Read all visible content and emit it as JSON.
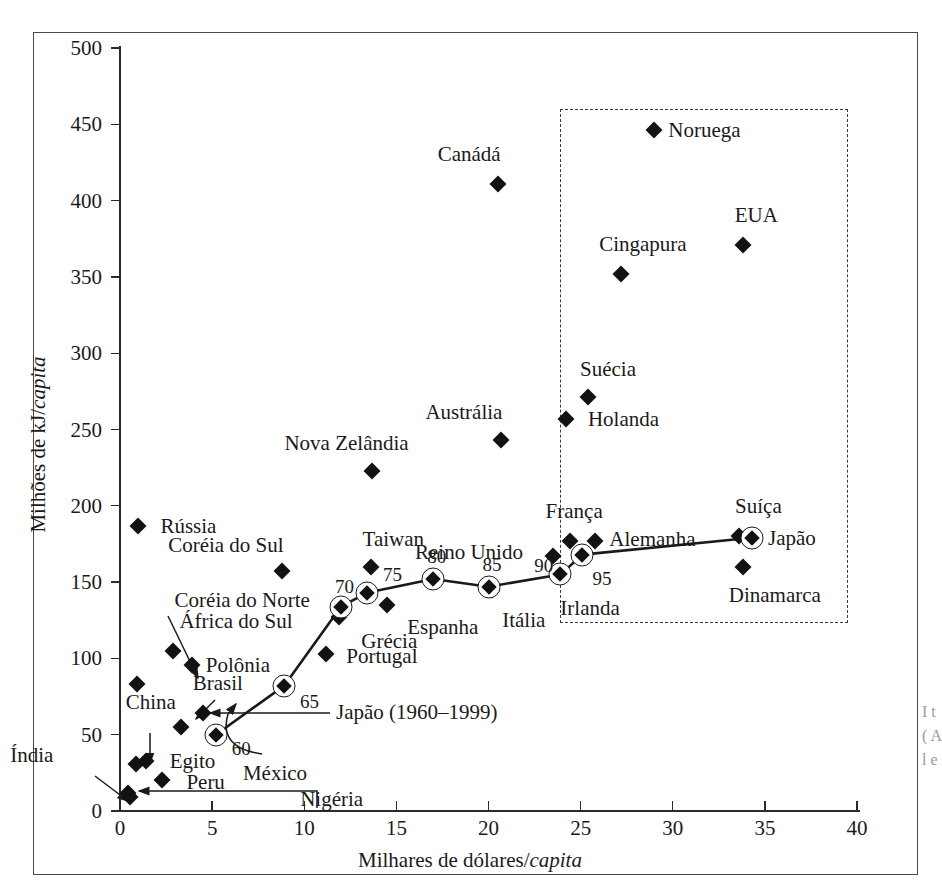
{
  "axes": {
    "x_title_main": "Milhares de dólares/",
    "x_title_italic": "capita",
    "y_title_main": "Milhões de kJ/",
    "y_title_italic": "capita",
    "x_ticks": [
      "0",
      "5",
      "10",
      "15",
      "20",
      "25",
      "30",
      "35",
      "40"
    ],
    "y_ticks": [
      "0",
      "50",
      "100",
      "150",
      "200",
      "250",
      "300",
      "350",
      "400",
      "450",
      "500"
    ],
    "xlim": [
      0,
      40
    ],
    "ylim": [
      0,
      500
    ]
  },
  "series_label": "Japão (1960–1999)",
  "chart_data": {
    "type": "scatter",
    "title": "",
    "xlabel": "Milhares de dólares/capita",
    "ylabel": "Milhões de kJ/capita",
    "xlim": [
      0,
      40
    ],
    "ylim": [
      0,
      500
    ],
    "grid": false,
    "legend": "none",
    "annotations": [
      "Dashed rectangle highlights high-income countries (x > 23.8, y 42–460)",
      "Japão (1960–1999) trajectory connects ringed markers labelled 60, 65, 70, 75, 80, 85, 90, 95"
    ],
    "points": [
      {
        "name": "Índia",
        "x": 0.45,
        "y": 12,
        "label_dx": -118,
        "label_dy": -38,
        "leader": true
      },
      {
        "name": "Nigéria",
        "x": 0.55,
        "y": 9,
        "label_dx": 170,
        "label_dy": 2,
        "leader": true
      },
      {
        "name": "China",
        "x": 0.85,
        "y": 31,
        "label_dx": -10,
        "label_dy": -62,
        "leader": true
      },
      {
        "name": "Coréia do Norte",
        "x": 0.9,
        "y": 83,
        "label_dx": 38,
        "label_dy": -84,
        "leader": true
      },
      {
        "name": "Egito",
        "x": 1.4,
        "y": 33,
        "label_dx": 24,
        "label_dy": 0,
        "leader": false
      },
      {
        "name": "Peru",
        "x": 2.3,
        "y": 20,
        "label_dx": 24,
        "label_dy": 2,
        "leader": false
      },
      {
        "name": "África do Sul",
        "x": 2.9,
        "y": 105,
        "label_dx": 6,
        "label_dy": -30,
        "leader": false
      },
      {
        "name": "Polônia",
        "x": 3.9,
        "y": 96,
        "label_dx": 14,
        "label_dy": 0,
        "leader": false
      },
      {
        "name": "Brasil",
        "x": 3.3,
        "y": 55,
        "label_dx": 12,
        "label_dy": -44,
        "leader": true
      },
      {
        "name": "México",
        "x": 4.5,
        "y": 64,
        "label_dx": 40,
        "label_dy": 60,
        "leader": true
      },
      {
        "name": "Rússia",
        "x": 1.0,
        "y": 187,
        "label_dx": 22,
        "label_dy": 0,
        "leader": false
      },
      {
        "name": "Coréia do Sul",
        "x": 8.8,
        "y": 157,
        "label_dx": -114,
        "label_dy": -26,
        "leader": false
      },
      {
        "name": "Portugal",
        "x": 11.2,
        "y": 103,
        "label_dx": 20,
        "label_dy": 2,
        "leader": false
      },
      {
        "name": "Grécia",
        "x": 11.9,
        "y": 127,
        "label_dx": 22,
        "label_dy": 24,
        "leader": false
      },
      {
        "name": "Taiwan",
        "x": 13.6,
        "y": 160,
        "label_dx": -8,
        "label_dy": -28,
        "leader": false
      },
      {
        "name": "Nova Zelândia",
        "x": 13.7,
        "y": 223,
        "label_dx": -88,
        "label_dy": -28,
        "leader": false
      },
      {
        "name": "Espanha",
        "x": 14.5,
        "y": 135,
        "label_dx": 20,
        "label_dy": 22,
        "leader": false
      },
      {
        "name": "Itália",
        "x": 20.2,
        "y": 145,
        "label_dx": 10,
        "label_dy": 30,
        "leader": false
      },
      {
        "name": "Austrália",
        "x": 20.7,
        "y": 243,
        "label_dx": -76,
        "label_dy": -28,
        "leader": false
      },
      {
        "name": "Reino Unido",
        "x": 23.5,
        "y": 167,
        "label_dx": -138,
        "label_dy": -4,
        "leader": false
      },
      {
        "name": "Canádá",
        "x": 20.5,
        "y": 411,
        "label_dx": -60,
        "label_dy": -30,
        "leader": false
      },
      {
        "name": "França",
        "x": 24.4,
        "y": 177,
        "label_dx": -24,
        "label_dy": -30,
        "leader": false
      },
      {
        "name": "Holanda",
        "x": 24.2,
        "y": 257,
        "label_dx": 22,
        "label_dy": 0,
        "leader": false
      },
      {
        "name": "Suécia",
        "x": 25.4,
        "y": 271,
        "label_dx": -8,
        "label_dy": -28,
        "leader": false
      },
      {
        "name": "Alemanha",
        "x": 25.8,
        "y": 177,
        "label_dx": 14,
        "label_dy": -2,
        "leader": false
      },
      {
        "name": "Cingapura",
        "x": 27.2,
        "y": 352,
        "label_dx": -22,
        "label_dy": -30,
        "leader": false
      },
      {
        "name": "EUA",
        "x": 33.8,
        "y": 371,
        "label_dx": -8,
        "label_dy": -30,
        "leader": false
      },
      {
        "name": "Suíça",
        "x": 33.6,
        "y": 180,
        "label_dx": -4,
        "label_dy": -30,
        "leader": false
      },
      {
        "name": "Dinamarca",
        "x": 33.8,
        "y": 160,
        "label_dx": -14,
        "label_dy": 28,
        "leader": false
      },
      {
        "name": "Noruega",
        "x": 29.0,
        "y": 446,
        "label_dx": 14,
        "label_dy": 0,
        "leader": false
      },
      {
        "name": "Irlanda",
        "x": 23.9,
        "y": 155,
        "label_dx": 0,
        "label_dy": 34,
        "leader": false
      }
    ],
    "series": [
      {
        "name": "Japão (1960–1999)",
        "marker": "ringed-diamond",
        "year_labels": [
          "60",
          "65",
          "70",
          "75",
          "80",
          "85",
          "90",
          "95"
        ],
        "x": [
          5.2,
          8.9,
          12.0,
          13.4,
          17.0,
          20.0,
          23.9,
          25.1,
          34.3
        ],
        "y": [
          50,
          82,
          134,
          143,
          152,
          147,
          155,
          168,
          179
        ],
        "point_names": [
          "60",
          "65",
          "70",
          "75",
          "80",
          "85",
          "90",
          "95",
          "Japão"
        ],
        "end_label": "Japão"
      }
    ]
  },
  "caption_sliver": "I t ( A l e"
}
